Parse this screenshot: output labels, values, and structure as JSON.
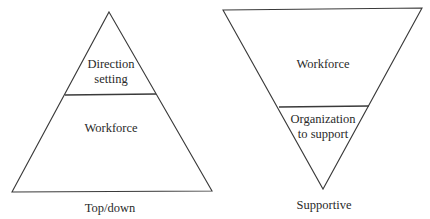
{
  "diagrams": [
    {
      "id": "top-down",
      "orientation": "upright-triangle",
      "caption": "Top/down",
      "sections": [
        {
          "position": "top",
          "label_lines": [
            "Direction",
            "setting"
          ]
        },
        {
          "position": "bottom",
          "label_lines": [
            "Workforce"
          ]
        }
      ]
    },
    {
      "id": "supportive",
      "orientation": "inverted-triangle",
      "caption": "Supportive",
      "sections": [
        {
          "position": "top",
          "label_lines": [
            "Workforce"
          ]
        },
        {
          "position": "bottom",
          "label_lines": [
            "Organization",
            "to support"
          ]
        }
      ]
    }
  ],
  "colors": {
    "background": "#ffffff",
    "stroke": "#3a3a3a",
    "text": "#2a2a2a"
  }
}
